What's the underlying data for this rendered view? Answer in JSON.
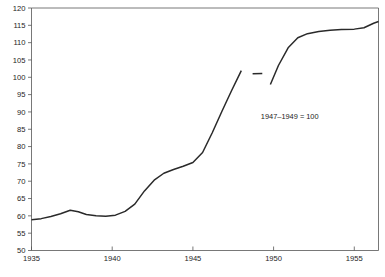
{
  "chart_data": {
    "type": "line",
    "title": "",
    "subtitle": "",
    "xlabel": "",
    "ylabel": "",
    "xlim": [
      1935,
      1956.5
    ],
    "ylim": [
      50,
      120
    ],
    "grid": false,
    "legend": null,
    "annotations": [
      {
        "text": "1947–1949 = 100",
        "x": 1951.0,
        "y": 88
      }
    ],
    "xticks": [
      1935,
      1940,
      1945,
      1950,
      1955
    ],
    "xticklabels": [
      "1935",
      "1940",
      "1945",
      "1950",
      "1955"
    ],
    "yticks": [
      50,
      55,
      60,
      65,
      70,
      75,
      80,
      85,
      90,
      95,
      100,
      105,
      110,
      115,
      120
    ],
    "yticklabels": [
      "50",
      "55",
      "60",
      "65",
      "70",
      "75",
      "80",
      "85",
      "90",
      "95",
      "100",
      "105",
      "110",
      "115",
      "120"
    ],
    "series": [
      {
        "name": "Consumer price index",
        "color": "#2a2a2a",
        "segments": [
          {
            "name": "segment-1",
            "x": [
              1935.0,
              1935.6,
              1936.2,
              1936.8,
              1937.4,
              1937.9,
              1938.4,
              1939.0,
              1939.6,
              1940.2,
              1940.8,
              1941.4,
              1942.0,
              1942.6,
              1943.2,
              1943.8,
              1944.4,
              1945.0,
              1945.6,
              1946.2,
              1946.8,
              1947.4,
              1948.0
            ],
            "y": [
              58.9,
              59.2,
              59.8,
              60.6,
              61.6,
              61.2,
              60.4,
              60.0,
              59.9,
              60.2,
              61.3,
              63.4,
              67.2,
              70.3,
              72.3,
              73.4,
              74.3,
              75.4,
              78.3,
              84.0,
              90.2,
              96.2,
              101.9
            ]
          },
          {
            "name": "segment-2",
            "x": [
              1948.7,
              1949.3
            ],
            "y": [
              101.0,
              101.1
            ]
          },
          {
            "name": "segment-3",
            "x": [
              1949.8,
              1950.3,
              1950.9,
              1951.5,
              1952.1,
              1952.8,
              1953.5,
              1954.2,
              1955.0,
              1955.6,
              1956.2,
              1956.5
            ],
            "y": [
              97.9,
              103.4,
              108.5,
              111.4,
              112.6,
              113.2,
              113.6,
              113.8,
              113.9,
              114.3,
              115.6,
              116.1
            ]
          }
        ]
      }
    ]
  },
  "figure": {
    "caption": ""
  }
}
